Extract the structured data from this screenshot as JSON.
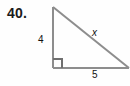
{
  "problem": {
    "number": "40."
  },
  "figure": {
    "type": "right-triangle",
    "labels": {
      "vertical_leg": "4",
      "horizontal_leg": "5",
      "hypotenuse": "x"
    },
    "colors": {
      "stroke": "#8d8d8d",
      "text": "#111111",
      "background": "#fefefe"
    },
    "geometry": {
      "apex": [
        53,
        7
      ],
      "right_angle_vertex": [
        53,
        68
      ],
      "right_vertex": [
        128,
        68
      ],
      "right_angle_marker_size": 9
    }
  }
}
